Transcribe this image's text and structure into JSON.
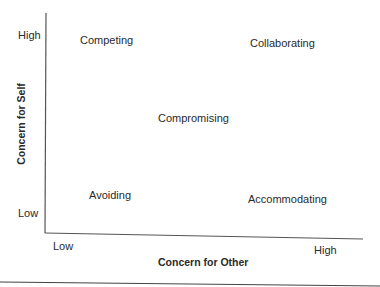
{
  "diagram": {
    "type": "conflict-styles-grid",
    "y_axis": {
      "title": "Concern for Self",
      "high": "High",
      "low": "Low"
    },
    "x_axis": {
      "title": "Concern for Other",
      "low": "Low",
      "high": "High"
    },
    "styles": {
      "competing": "Competing",
      "collaborating": "Collaborating",
      "compromising": "Compromising",
      "avoiding": "Avoiding",
      "accommodating": "Accommodating"
    },
    "colors": {
      "text": "#2a2a2a",
      "axis": "#555555"
    }
  }
}
